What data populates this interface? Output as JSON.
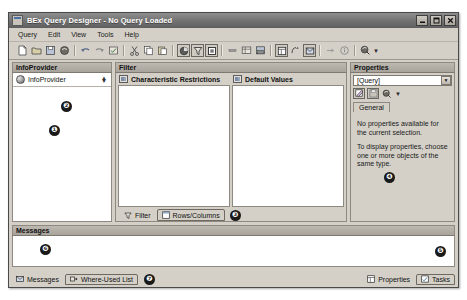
{
  "window": {
    "title": "BEx Query Designer - No Query Loaded",
    "icon": "application-icon",
    "buttons": {
      "minimize": "minimize-button",
      "maximize": "maximize-button",
      "close": "close-button"
    }
  },
  "menubar": {
    "items": [
      {
        "label": "Query"
      },
      {
        "label": "Edit"
      },
      {
        "label": "View"
      },
      {
        "label": "Tools"
      },
      {
        "label": "Help"
      }
    ]
  },
  "toolbar": {
    "buttons": [
      {
        "name": "new-query-icon"
      },
      {
        "name": "open-query-icon"
      },
      {
        "name": "save-query-icon"
      },
      {
        "name": "save-as-icon"
      },
      {
        "name": "undo-icon"
      },
      {
        "name": "redo-icon"
      },
      {
        "name": "check-query-icon"
      },
      {
        "name": "cut-icon"
      },
      {
        "name": "copy-icon"
      },
      {
        "name": "paste-icon"
      },
      {
        "name": "global-definition-icon"
      },
      {
        "name": "filter-icon"
      },
      {
        "name": "cell-definition-icon"
      },
      {
        "name": "exception-icon"
      },
      {
        "name": "condition-icon"
      },
      {
        "name": "table-display-icon"
      },
      {
        "name": "properties-panel-icon"
      },
      {
        "name": "tasks-panel-icon"
      },
      {
        "name": "messages-panel-icon"
      },
      {
        "name": "where-used-icon"
      },
      {
        "name": "info-icon"
      },
      {
        "name": "help-pointer-icon"
      }
    ]
  },
  "infoprovider": {
    "header": "InfoProvider",
    "item": {
      "label": "InfoProvider",
      "icon": "infoprovider-sphere-icon"
    },
    "callout": "❶"
  },
  "filter": {
    "header": "Filter",
    "characteristic_restrictions": {
      "label": "Characteristic Restrictions",
      "icon": "characteristic-restrictions-icon"
    },
    "default_values": {
      "label": "Default Values",
      "icon": "default-values-icon"
    },
    "callout": "❷",
    "tabs": [
      {
        "label": "Filter",
        "icon": "filter-funnel-icon",
        "active": false
      },
      {
        "label": "Rows/Columns",
        "icon": "rows-columns-icon",
        "active": true
      }
    ],
    "tabs_callout": "❸"
  },
  "properties": {
    "header": "Properties",
    "selector_value": "[Query]",
    "toolbar_buttons": [
      {
        "name": "property-edit-icon"
      },
      {
        "name": "property-save-icon"
      },
      {
        "name": "property-help-icon"
      }
    ],
    "tabs": [
      {
        "label": "General",
        "active": true
      }
    ],
    "empty_text_1": "No properties available for the current selection.",
    "empty_text_2": "To display properties, choose one or more objects of the same type.",
    "callout": "❹"
  },
  "messages": {
    "header": "Messages",
    "callout": "❻"
  },
  "statusbar": {
    "left_tabs": [
      {
        "label": "Messages",
        "icon": "messages-icon",
        "active": false
      },
      {
        "label": "Where-Used List",
        "icon": "where-used-list-icon",
        "active": true
      }
    ],
    "left_callout": "❼",
    "right_tabs": [
      {
        "label": "Properties",
        "icon": "properties-icon",
        "active": false
      },
      {
        "label": "Tasks",
        "icon": "tasks-icon",
        "active": true
      }
    ],
    "right_callout": "❺"
  },
  "colors": {
    "chrome": "#d4d0c8",
    "panel_header": "#b0aca4",
    "titlebar": "#767676",
    "content": "#ffffff",
    "text": "#1a1a1a"
  }
}
